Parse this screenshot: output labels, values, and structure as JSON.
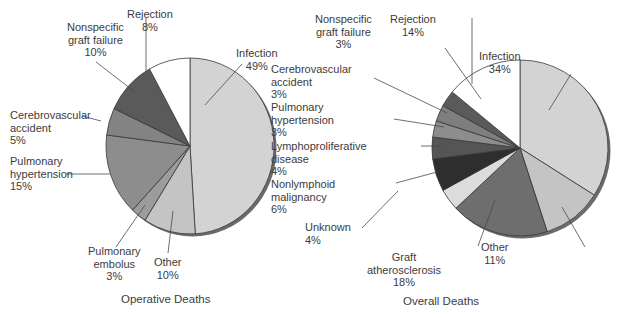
{
  "chart_data": [
    {
      "type": "pie",
      "title": "Operative Deaths",
      "center": [
        190,
        146
      ],
      "radius": [
        84,
        88
      ],
      "start_angle_deg": 0,
      "direction": "clockwise",
      "slices": [
        {
          "label": "Infection",
          "value": 49,
          "pct_label": "49%",
          "color": "#d3d3d3"
        },
        {
          "label": "Other",
          "value": 10,
          "pct_label": "10%",
          "color": "#c4c4c4"
        },
        {
          "label": "Pulmonary embolus",
          "value": 3,
          "pct_label": "3%",
          "color": "#9c9c9c"
        },
        {
          "label": "Pulmonary hypertension",
          "value": 15,
          "pct_label": "15%",
          "color": "#8d8d8d"
        },
        {
          "label": "Cerebrovascular accident",
          "value": 5,
          "pct_label": "5%",
          "color": "#838383"
        },
        {
          "label": "Nonspecific graft failure",
          "value": 10,
          "pct_label": "10%",
          "color": "#5a5a5a"
        },
        {
          "label": "Rejection",
          "value": 8,
          "pct_label": "8%",
          "color": "#ffffff"
        }
      ]
    },
    {
      "type": "pie",
      "title": "Overall Deaths",
      "center": [
        520,
        148
      ],
      "radius": [
        88,
        88
      ],
      "start_angle_deg": 0,
      "direction": "clockwise",
      "slices": [
        {
          "label": "Infection",
          "value": 34,
          "pct_label": "34%",
          "color": "#d3d3d3"
        },
        {
          "label": "Other",
          "value": 11,
          "pct_label": "11%",
          "color": "#c4c4c4"
        },
        {
          "label": "Graft atherosclerosis",
          "value": 18,
          "pct_label": "18%",
          "color": "#6e6e6e"
        },
        {
          "label": "Unknown",
          "value": 4,
          "pct_label": "4%",
          "color": "#dcdcdc"
        },
        {
          "label": "Nonlymphoid malignancy",
          "value": 6,
          "pct_label": "6%",
          "color": "#2e2e2e"
        },
        {
          "label": "Lymphoproliferative disease",
          "value": 4,
          "pct_label": "4%",
          "color": "#555555"
        },
        {
          "label": "Pulmonary hypertension",
          "value": 3,
          "pct_label": "3%",
          "color": "#8d8d8d"
        },
        {
          "label": "Cerebrovascular accident",
          "value": 3,
          "pct_label": "3%",
          "color": "#7e7e7e"
        },
        {
          "label": "Nonspecific graft failure",
          "value": 3,
          "pct_label": "3%",
          "color": "#5a5a5a"
        },
        {
          "label": "Rejection",
          "value": 14,
          "pct_label": "14%",
          "color": "#ffffff"
        }
      ]
    }
  ],
  "labels": {
    "left": {
      "rejection": "Rejection\n8%",
      "nonspecific": "Nonspecific\ngraft failure\n10%",
      "infection": "Infection\n49%",
      "cerebrovascular": "Cerebrovascular\naccident\n5%",
      "pulm_hypertension": "Pulmonary\nhypertension\n15%",
      "pulm_embolus": "Pulmonary\nembolus\n3%",
      "other": "Other\n10%",
      "title": "Operative Deaths"
    },
    "right": {
      "nonspecific": "Nonspecific\ngraft failure\n3%",
      "rejection": "Rejection\n14%",
      "infection": "Infection\n34%",
      "cerebrovascular": "Cerebrovascular\naccident\n3%",
      "pulm_hypertension": "Pulmonary\nhypertension\n3%",
      "lymphoproliferative": "Lymphoproliferative\ndisease\n4%",
      "nonlymphoid": "Nonlymphoid\nmalignancy\n6%",
      "unknown": "Unknown\n4%",
      "graft_atherosclerosis": "Graft\natherosclerosis\n18%",
      "other": "Other\n11%",
      "title": "Overall Deaths"
    }
  },
  "colors": {
    "outline": "#3a3a3a",
    "shadow": "#6a6a6a",
    "leader": "#4a4a4a"
  }
}
